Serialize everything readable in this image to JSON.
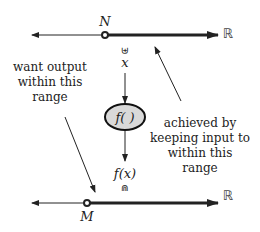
{
  "diagram": {
    "top_axis": {
      "point_label": "N",
      "space_label": "ℝ"
    },
    "bottom_axis": {
      "point_label": "M",
      "space_label": "ℝ"
    },
    "input": {
      "subset_symbol": "⊎",
      "label": "x"
    },
    "function": {
      "label": "f( )",
      "fill": "#d9d9d9"
    },
    "output": {
      "label": "f(x)",
      "subset_symbol": "⋒"
    },
    "left_note": {
      "lines": [
        "want output",
        "within this",
        "range"
      ]
    },
    "right_note": {
      "lines": [
        "achieved by",
        "keeping input to",
        "within this",
        "range"
      ]
    }
  }
}
